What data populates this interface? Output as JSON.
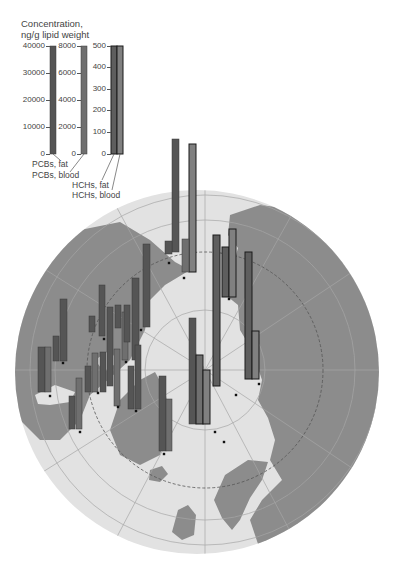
{
  "legend": {
    "title_line1": "Concentration,",
    "title_line2": "ng/g lipid weight",
    "axes": [
      {
        "name": "pcbs-fat-axis",
        "x": 50,
        "ticks": [
          {
            "label": "40000",
            "y": 46
          },
          {
            "label": "30000",
            "y": 73
          },
          {
            "label": "20000",
            "y": 100
          },
          {
            "label": "10000",
            "y": 127
          },
          {
            "label": "0",
            "y": 154
          }
        ]
      },
      {
        "name": "pcbs-blood-axis",
        "x": 81,
        "ticks": [
          {
            "label": "8000",
            "y": 46
          },
          {
            "label": "6000",
            "y": 73
          },
          {
            "label": "4000",
            "y": 100
          },
          {
            "label": "2000",
            "y": 127
          },
          {
            "label": "0",
            "y": 154
          }
        ]
      },
      {
        "name": "hchs-axis",
        "x": 111,
        "ticks": [
          {
            "label": "500",
            "y": 46
          },
          {
            "label": "400",
            "y": 67
          },
          {
            "label": "300",
            "y": 89
          },
          {
            "label": "200",
            "y": 110
          },
          {
            "label": "100",
            "y": 132
          },
          {
            "label": "0",
            "y": 154
          }
        ]
      }
    ],
    "series_labels": {
      "pcbs_fat": "PCBs, fat",
      "pcbs_blood": "PCBs, blood",
      "hchs_fat": "HCHs, fat",
      "hchs_blood": "HCHs, blood"
    },
    "legend_bars": [
      {
        "series": "pcbs_fat",
        "x": 50,
        "top": 46,
        "bottom": 154,
        "w": 6
      },
      {
        "series": "pcbs_blood",
        "x": 81,
        "top": 46,
        "bottom": 154,
        "w": 6
      },
      {
        "series": "hchs_fat",
        "x": 111,
        "top": 46,
        "bottom": 154,
        "w": 6
      },
      {
        "series": "hchs_blood",
        "x": 117,
        "top": 46,
        "bottom": 154,
        "w": 6
      }
    ]
  },
  "colors": {
    "pcbs_fat": "#555555",
    "pcbs_blood": "#6f6f6f",
    "hchs_fat": "#5e5e5e",
    "hchs_blood": "#808080",
    "ocean": "#e2e2e2",
    "land": "#8c8c8c",
    "grid": "#a8a8a8",
    "text": "#444444"
  },
  "map": {
    "projection": "polar",
    "center": [
      197,
      372
    ],
    "radius": 182,
    "arctic_circle_radius": 118,
    "arctic_circle_center": [
      205,
      370
    ]
  },
  "chart_data": {
    "type": "bar",
    "title": "Concentration, ng/g lipid weight",
    "series": [
      {
        "name": "PCBs, fat",
        "unit": "ng/g lipid weight",
        "axis_max": 40000
      },
      {
        "name": "PCBs, blood",
        "unit": "ng/g lipid weight",
        "axis_max": 8000
      },
      {
        "name": "HCHs, fat",
        "unit": "ng/g lipid weight",
        "axis_max": 500
      },
      {
        "name": "HCHs, blood",
        "unit": "ng/g lipid weight",
        "axis_max": 500
      }
    ],
    "legend_ticks": {
      "pcbs_fat": [
        0,
        10000,
        20000,
        30000,
        40000
      ],
      "pcbs_blood": [
        0,
        2000,
        4000,
        6000,
        8000
      ],
      "hchs": [
        0,
        100,
        200,
        300,
        400,
        500
      ]
    },
    "bars": [
      {
        "series": "pcbs_fat",
        "x": 172,
        "top": 139,
        "bottom": 252,
        "w": 7
      },
      {
        "series": "pcbs_fat",
        "x": 165,
        "top": 241,
        "bottom": 254,
        "w": 7
      },
      {
        "series": "hchs_blood",
        "x": 189,
        "top": 144,
        "bottom": 272,
        "w": 7,
        "outline": true
      },
      {
        "series": "pcbs_blood",
        "x": 182,
        "top": 239,
        "bottom": 272,
        "w": 7
      },
      {
        "series": "hchs_fat",
        "x": 213,
        "top": 235,
        "bottom": 386,
        "w": 7,
        "outline": true
      },
      {
        "series": "hchs_fat",
        "x": 222,
        "top": 247,
        "bottom": 297,
        "w": 7,
        "outline": true
      },
      {
        "series": "hchs_blood",
        "x": 229,
        "top": 229,
        "bottom": 297,
        "w": 7,
        "outline": true
      },
      {
        "series": "hchs_fat",
        "x": 245,
        "top": 252,
        "bottom": 379,
        "w": 7,
        "outline": true
      },
      {
        "series": "hchs_blood",
        "x": 252,
        "top": 331,
        "bottom": 379,
        "w": 7,
        "outline": true
      },
      {
        "series": "pcbs_fat",
        "x": 143,
        "top": 244,
        "bottom": 327,
        "w": 7
      },
      {
        "series": "pcbs_fat",
        "x": 132,
        "top": 278,
        "bottom": 360,
        "w": 7
      },
      {
        "series": "pcbs_blood",
        "x": 122,
        "top": 312,
        "bottom": 360,
        "w": 6
      },
      {
        "series": "pcbs_fat",
        "x": 115,
        "top": 305,
        "bottom": 328,
        "w": 6
      },
      {
        "series": "pcbs_fat",
        "x": 124,
        "top": 305,
        "bottom": 342,
        "w": 6
      },
      {
        "series": "pcbs_fat",
        "x": 99,
        "top": 285,
        "bottom": 336,
        "w": 6
      },
      {
        "series": "pcbs_fat",
        "x": 89,
        "top": 316,
        "bottom": 332,
        "w": 6
      },
      {
        "series": "pcbs_fat",
        "x": 107,
        "top": 307,
        "bottom": 386,
        "w": 6
      },
      {
        "series": "pcbs_blood",
        "x": 114,
        "top": 349,
        "bottom": 406,
        "w": 6
      },
      {
        "series": "pcbs_fat",
        "x": 60,
        "top": 299,
        "bottom": 361,
        "w": 7
      },
      {
        "series": "pcbs_fat",
        "x": 53,
        "top": 336,
        "bottom": 361,
        "w": 6
      },
      {
        "series": "pcbs_fat",
        "x": 38,
        "top": 347,
        "bottom": 392,
        "w": 7
      },
      {
        "series": "pcbs_blood",
        "x": 45,
        "top": 347,
        "bottom": 392,
        "w": 6
      },
      {
        "series": "pcbs_fat",
        "x": 85,
        "top": 366,
        "bottom": 392,
        "w": 6
      },
      {
        "series": "pcbs_blood",
        "x": 92,
        "top": 353,
        "bottom": 392,
        "w": 6
      },
      {
        "series": "pcbs_fat",
        "x": 100,
        "top": 352,
        "bottom": 392,
        "w": 6
      },
      {
        "series": "pcbs_fat",
        "x": 69,
        "top": 396,
        "bottom": 429,
        "w": 6
      },
      {
        "series": "pcbs_blood",
        "x": 76,
        "top": 378,
        "bottom": 429,
        "w": 6
      },
      {
        "series": "pcbs_fat",
        "x": 128,
        "top": 366,
        "bottom": 409,
        "w": 6
      },
      {
        "series": "pcbs_fat",
        "x": 135,
        "top": 345,
        "bottom": 409,
        "w": 6
      },
      {
        "series": "pcbs_fat",
        "x": 159,
        "top": 376,
        "bottom": 451,
        "w": 7
      },
      {
        "series": "pcbs_blood",
        "x": 166,
        "top": 399,
        "bottom": 451,
        "w": 6
      },
      {
        "series": "pcbs_fat",
        "x": 189,
        "top": 318,
        "bottom": 424,
        "w": 7
      },
      {
        "series": "pcbs_blood",
        "x": 196,
        "top": 355,
        "bottom": 424,
        "w": 7,
        "outline": true
      },
      {
        "series": "hchs_blood",
        "x": 203,
        "top": 370,
        "bottom": 424,
        "w": 7,
        "outline": true
      }
    ],
    "site_markers": [
      [
        169,
        263
      ],
      [
        184,
        278
      ],
      [
        229,
        299
      ],
      [
        259,
        384
      ],
      [
        141,
        330
      ],
      [
        126,
        362
      ],
      [
        104,
        339
      ],
      [
        118,
        407
      ],
      [
        63,
        363
      ],
      [
        50,
        396
      ],
      [
        80,
        432
      ],
      [
        98,
        393
      ],
      [
        136,
        411
      ],
      [
        164,
        454
      ],
      [
        215,
        432
      ],
      [
        236,
        395
      ],
      [
        224,
        442
      ]
    ]
  }
}
